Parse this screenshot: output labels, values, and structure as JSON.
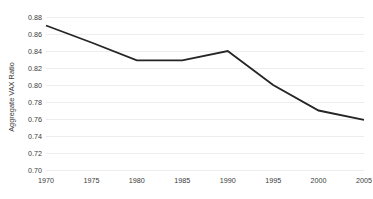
{
  "chart_data": {
    "type": "line",
    "title": "",
    "subtitle": "",
    "xlabel": "",
    "ylabel": "Aggregate VAX Ratio",
    "x": [
      1970,
      1975,
      1980,
      1985,
      1990,
      1995,
      2000,
      2005
    ],
    "xtick_labels": [
      "1970",
      "1975",
      "1980",
      "1985",
      "1990",
      "1995",
      "2000",
      "2005"
    ],
    "xlim": [
      1970,
      2005
    ],
    "ylim": [
      0.7,
      0.88
    ],
    "yticks": [
      0.7,
      0.72,
      0.74,
      0.76,
      0.78,
      0.8,
      0.82,
      0.84,
      0.86,
      0.88
    ],
    "ytick_labels": [
      "0.70",
      "0.72",
      "0.74",
      "0.76",
      "0.78",
      "0.80",
      "0.82",
      "0.84",
      "0.86",
      "0.88"
    ],
    "series": [
      {
        "name": "Aggregate VAX Ratio",
        "values": [
          0.87,
          0.85,
          0.829,
          0.829,
          0.84,
          0.8,
          0.77,
          0.759
        ],
        "color": "#252525",
        "line_width": 1.85,
        "markers": false
      }
    ],
    "grid": {
      "horizontal": true,
      "vertical": false,
      "color": "#e9e9ec"
    },
    "legend": {
      "visible": false,
      "position": "none"
    },
    "axis_spines": {
      "left": false,
      "right": false,
      "top": false,
      "bottom": false
    },
    "background_color": "#ffffff",
    "annotations": []
  }
}
